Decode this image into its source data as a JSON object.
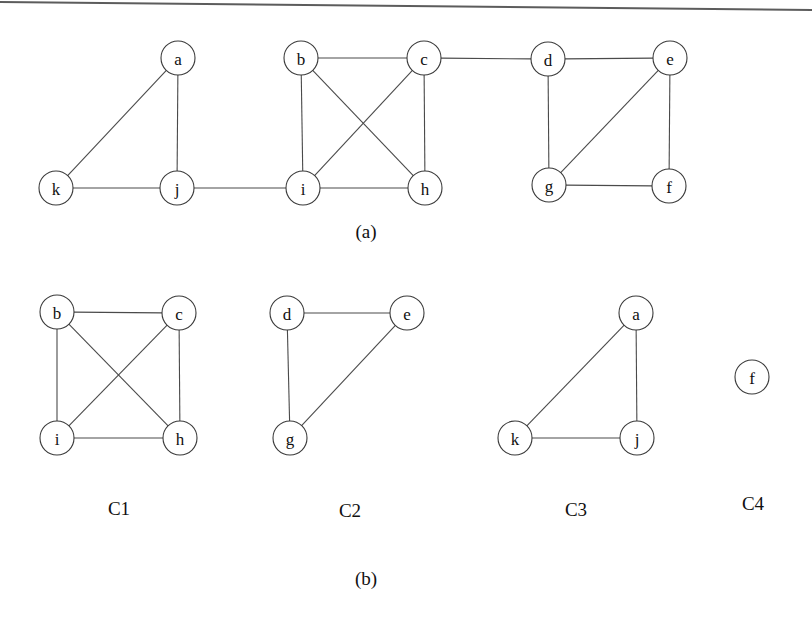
{
  "figure": {
    "top_rule": {
      "x1": 0,
      "y1": 2,
      "x2": 812,
      "y2": 10
    },
    "panel_a": {
      "caption": "(a)",
      "caption_x": 366,
      "caption_y": 231,
      "node_radius": 17,
      "nodes": [
        {
          "id": "a",
          "label": "a",
          "x": 178,
          "y": 58
        },
        {
          "id": "b",
          "label": "b",
          "x": 301,
          "y": 58
        },
        {
          "id": "c",
          "label": "c",
          "x": 424,
          "y": 58
        },
        {
          "id": "d",
          "label": "d",
          "x": 548,
          "y": 59
        },
        {
          "id": "e",
          "label": "e",
          "x": 670,
          "y": 58
        },
        {
          "id": "f",
          "label": "f",
          "x": 669,
          "y": 186
        },
        {
          "id": "g",
          "label": "g",
          "x": 549,
          "y": 185
        },
        {
          "id": "h",
          "label": "h",
          "x": 425,
          "y": 188
        },
        {
          "id": "i",
          "label": "i",
          "x": 303,
          "y": 188
        },
        {
          "id": "j",
          "label": "j",
          "x": 177,
          "y": 188
        },
        {
          "id": "k",
          "label": "k",
          "x": 56,
          "y": 188
        }
      ],
      "edges": [
        [
          "a",
          "k"
        ],
        [
          "a",
          "j"
        ],
        [
          "k",
          "j"
        ],
        [
          "j",
          "i"
        ],
        [
          "b",
          "c"
        ],
        [
          "b",
          "i"
        ],
        [
          "b",
          "h"
        ],
        [
          "c",
          "i"
        ],
        [
          "c",
          "h"
        ],
        [
          "i",
          "h"
        ],
        [
          "c",
          "d"
        ],
        [
          "d",
          "e"
        ],
        [
          "d",
          "g"
        ],
        [
          "e",
          "g"
        ],
        [
          "e",
          "f"
        ],
        [
          "g",
          "f"
        ]
      ]
    },
    "panel_b": {
      "caption": "(b)",
      "caption_x": 366,
      "caption_y": 578,
      "node_radius": 17,
      "clusters": [
        {
          "name": "C1",
          "label_x": 119,
          "label_y": 508,
          "nodes": [
            {
              "id": "b",
              "label": "b",
              "x": 57,
              "y": 312
            },
            {
              "id": "c",
              "label": "c",
              "x": 179,
              "y": 313
            },
            {
              "id": "i",
              "label": "i",
              "x": 57,
              "y": 438
            },
            {
              "id": "h",
              "label": "h",
              "x": 180,
              "y": 438
            }
          ],
          "edges": [
            [
              "b",
              "c"
            ],
            [
              "b",
              "i"
            ],
            [
              "b",
              "h"
            ],
            [
              "c",
              "i"
            ],
            [
              "c",
              "h"
            ],
            [
              "i",
              "h"
            ]
          ]
        },
        {
          "name": "C2",
          "label_x": 350,
          "label_y": 510,
          "nodes": [
            {
              "id": "d",
              "label": "d",
              "x": 287,
              "y": 313
            },
            {
              "id": "e",
              "label": "e",
              "x": 407,
              "y": 313
            },
            {
              "id": "g",
              "label": "g",
              "x": 290,
              "y": 438
            }
          ],
          "edges": [
            [
              "d",
              "e"
            ],
            [
              "d",
              "g"
            ],
            [
              "e",
              "g"
            ]
          ]
        },
        {
          "name": "C3",
          "label_x": 576,
          "label_y": 509,
          "nodes": [
            {
              "id": "a",
              "label": "a",
              "x": 636,
              "y": 313
            },
            {
              "id": "k",
              "label": "k",
              "x": 515,
              "y": 438
            },
            {
              "id": "j",
              "label": "j",
              "x": 637,
              "y": 438
            }
          ],
          "edges": [
            [
              "a",
              "k"
            ],
            [
              "a",
              "j"
            ],
            [
              "k",
              "j"
            ]
          ]
        },
        {
          "name": "C4",
          "label_x": 753,
          "label_y": 503,
          "nodes": [
            {
              "id": "f",
              "label": "f",
              "x": 752,
              "y": 377
            }
          ],
          "edges": []
        }
      ]
    }
  }
}
